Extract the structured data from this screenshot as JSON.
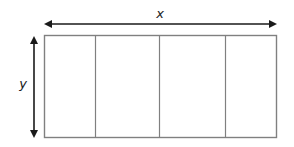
{
  "diagram": {
    "labels": {
      "width": "x",
      "height": "y"
    },
    "rectangle": {
      "sections": 4,
      "stroke_color": "#808080"
    },
    "arrows": {
      "color": "#1a1a1a",
      "horizontal": "double-headed, spans rectangle width",
      "vertical": "double-headed, spans rectangle height"
    },
    "colors": {
      "background": "#ffffff",
      "outline": "#808080",
      "arrow": "#1a1a1a",
      "text": "#222222"
    }
  }
}
